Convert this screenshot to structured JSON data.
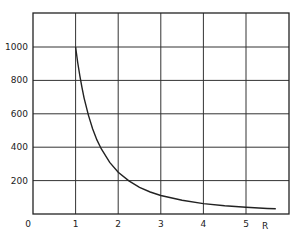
{
  "chart_data": {
    "type": "line",
    "title": "",
    "xlabel": "R",
    "ylabel": "",
    "xlim": [
      0,
      5.7
    ],
    "ylim": [
      0,
      1200
    ],
    "grid": true,
    "legend": null,
    "x_ticks": [
      "0",
      "1",
      "2",
      "3",
      "4",
      "5"
    ],
    "y_ticks": [
      "200",
      "400",
      "600",
      "800",
      "1000"
    ],
    "series": [
      {
        "name": "curve",
        "x": [
          1.0,
          1.05,
          1.1,
          1.15,
          1.2,
          1.3,
          1.4,
          1.5,
          1.6,
          1.8,
          2.0,
          2.25,
          2.5,
          2.75,
          3.0,
          3.5,
          4.0,
          4.5,
          5.0,
          5.5,
          5.7
        ],
        "values": [
          1000,
          907,
          826,
          756,
          694,
          592,
          510,
          444,
          391,
          309,
          250,
          198,
          160,
          132,
          111,
          82,
          62,
          49,
          40,
          33,
          31
        ]
      }
    ]
  },
  "labels": {
    "origin": "0",
    "x_axis_name": "R"
  }
}
